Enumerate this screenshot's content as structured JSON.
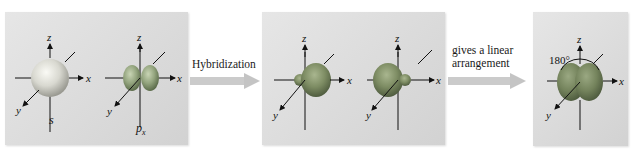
{
  "diagram": {
    "panels": [
      {
        "id": "atomic-orbitals",
        "orbitals": [
          {
            "name": "s-orbital",
            "label": "s",
            "axes": {
              "x": "x",
              "y": "y",
              "z": "z"
            }
          },
          {
            "name": "px-orbital",
            "label": "p",
            "subscript": "x",
            "axes": {
              "x": "x",
              "y": "y",
              "z": "z"
            }
          }
        ]
      },
      {
        "id": "sp-hybrid-orbitals",
        "orbitals": [
          {
            "name": "sp-hybrid-1",
            "axes": {
              "x": "x",
              "y": "y",
              "z": "z"
            }
          },
          {
            "name": "sp-hybrid-2",
            "axes": {
              "x": "x",
              "y": "y",
              "z": "z"
            }
          }
        ]
      },
      {
        "id": "linear-arrangement",
        "orbitals": [
          {
            "name": "sp-combined",
            "angle": "180°",
            "axes": {
              "x": "x",
              "y": "y",
              "z": "z"
            }
          }
        ]
      }
    ],
    "arrows": [
      {
        "label": "Hybridization"
      },
      {
        "label_line1": "gives a linear",
        "label_line2": "arrangement"
      }
    ],
    "colors": {
      "s_orbital": "#c8c8c0",
      "p_orbital": "#8fa07a",
      "hybrid_large": "#7a8a62",
      "hybrid_small": "#8b9b74",
      "panel_bg": "#dcdcdc",
      "arrow": "#c9c9c9"
    }
  }
}
